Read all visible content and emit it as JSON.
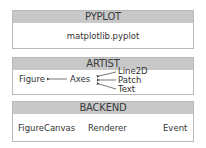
{
  "pyplot": {
    "header": "PYPLOT",
    "module": "matplotlib.pyplot"
  },
  "artist": {
    "header": "ARTIST",
    "figure": "Figure",
    "axes": "Axes",
    "children": [
      "Line2D",
      "Patch",
      "Text"
    ]
  },
  "backend": {
    "header": "BACKEND",
    "items": [
      "FigureCanvas",
      "Renderer",
      "Event"
    ]
  },
  "colors": {
    "header_bg": "#c8c8c8",
    "border": "#b8b8b8",
    "text": "#333333"
  }
}
